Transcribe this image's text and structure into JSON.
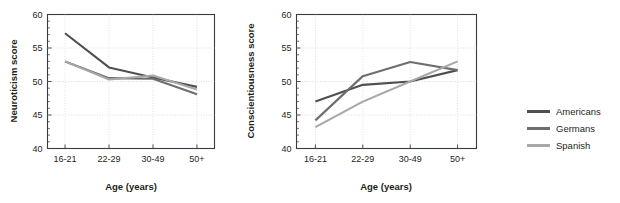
{
  "figure": {
    "caption_fragment": ""
  },
  "legend": {
    "position": "right",
    "items": [
      {
        "label": "Americans",
        "color": "#4f4f4f"
      },
      {
        "label": "Germans",
        "color": "#6e6e6e"
      },
      {
        "label": "Spanish",
        "color": "#a8a8a8"
      }
    ]
  },
  "chart_data": [
    {
      "type": "line",
      "title": "",
      "xlabel": "Age (years)",
      "ylabel": "Neuroticism score",
      "categories": [
        "16-21",
        "22-29",
        "30-49",
        "50+"
      ],
      "ylim": [
        40,
        60
      ],
      "yticks": [
        40,
        45,
        50,
        55,
        60
      ],
      "ytick_labels": [
        "40",
        "45",
        "50",
        "55",
        "60"
      ],
      "minor_ytick_step": 1,
      "grid": true,
      "series": [
        {
          "name": "Americans",
          "color": "#4f4f4f",
          "values": [
            57.2,
            52.1,
            50.6,
            49.2
          ]
        },
        {
          "name": "Germans",
          "color": "#6e6e6e",
          "values": [
            53.0,
            50.5,
            50.4,
            48.1
          ]
        },
        {
          "name": "Spanish",
          "color": "#a8a8a8",
          "values": [
            53.0,
            50.3,
            50.9,
            48.8
          ]
        }
      ]
    },
    {
      "type": "line",
      "title": "",
      "xlabel": "Age (years)",
      "ylabel": "Conscientiousness score",
      "categories": [
        "16-21",
        "22-29",
        "30-49",
        "50+"
      ],
      "ylim": [
        40,
        60
      ],
      "yticks": [
        40,
        45,
        50,
        55,
        60
      ],
      "ytick_labels": [
        "40",
        "45",
        "50",
        "55",
        "60"
      ],
      "minor_ytick_step": 1,
      "grid": true,
      "series": [
        {
          "name": "Americans",
          "color": "#4f4f4f",
          "values": [
            47.0,
            49.5,
            50.0,
            51.7
          ]
        },
        {
          "name": "Germans",
          "color": "#6e6e6e",
          "values": [
            44.2,
            50.8,
            52.9,
            51.7
          ]
        },
        {
          "name": "Spanish",
          "color": "#a8a8a8",
          "values": [
            43.2,
            47.0,
            50.0,
            53.0
          ]
        }
      ]
    }
  ]
}
